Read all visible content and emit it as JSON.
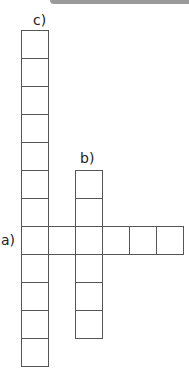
{
  "puzzle": {
    "labels": {
      "a": "a)",
      "b": "b)",
      "c": "c)"
    },
    "grid": {
      "cell_size": 27,
      "origin_x": 21,
      "origin_y": 30
    },
    "words": {
      "a": {
        "direction": "across",
        "length": 6,
        "start_col": 0,
        "start_row": 7
      },
      "b": {
        "direction": "down",
        "length": 6,
        "start_col": 2,
        "start_row": 5
      },
      "c": {
        "direction": "down",
        "length": 12,
        "start_col": 0,
        "start_row": 0
      }
    },
    "line_color": "#555555"
  }
}
